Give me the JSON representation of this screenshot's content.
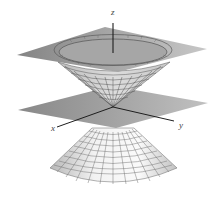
{
  "figure": {
    "axes": {
      "x_label": "x",
      "y_label": "y",
      "z_label": "z"
    },
    "colors": {
      "plane_fill": "#8f8f8f",
      "plane_fill_light": "#b5b5b5",
      "cone_fill": "#e6e6e6",
      "mesh_stroke": "#555555",
      "axis_stroke": "#222222"
    }
  }
}
